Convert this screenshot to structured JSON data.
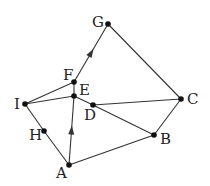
{
  "diagram": {
    "width": 210,
    "height": 186,
    "colors": {
      "edge": "#333333",
      "node": "#111111",
      "label": "#222222",
      "background": "#ffffff"
    },
    "nodes": [
      {
        "id": "G",
        "x": 108,
        "y": 24,
        "label": "G",
        "lx": 92,
        "ly": 27
      },
      {
        "id": "C",
        "x": 181,
        "y": 99,
        "label": "C",
        "lx": 187,
        "ly": 104
      },
      {
        "id": "B",
        "x": 154,
        "y": 135,
        "label": "B",
        "lx": 160,
        "ly": 144
      },
      {
        "id": "D",
        "x": 93,
        "y": 105,
        "label": "D",
        "lx": 84,
        "ly": 120
      },
      {
        "id": "E",
        "x": 74,
        "y": 96,
        "label": "E",
        "lx": 79,
        "ly": 95
      },
      {
        "id": "F",
        "x": 74,
        "y": 82,
        "label": "F",
        "lx": 63,
        "ly": 80
      },
      {
        "id": "I",
        "x": 25,
        "y": 104,
        "label": "I",
        "lx": 14,
        "ly": 109
      },
      {
        "id": "H",
        "x": 44,
        "y": 131,
        "label": "H",
        "lx": 29,
        "ly": 140
      },
      {
        "id": "A",
        "x": 69,
        "y": 165,
        "label": "A",
        "lx": 56,
        "ly": 178
      }
    ],
    "edges": [
      {
        "from": "F",
        "to": "G",
        "arrow": true
      },
      {
        "from": "G",
        "to": "C",
        "arrow": false
      },
      {
        "from": "C",
        "to": "B",
        "arrow": false
      },
      {
        "from": "D",
        "to": "C",
        "arrow": false
      },
      {
        "from": "E",
        "to": "D",
        "arrow": false
      },
      {
        "from": "D",
        "to": "B",
        "arrow": false
      },
      {
        "from": "A",
        "to": "B",
        "arrow": false
      },
      {
        "from": "A",
        "to": "E",
        "arrow": true
      },
      {
        "from": "I",
        "to": "F",
        "arrow": false
      },
      {
        "from": "I",
        "to": "E",
        "arrow": false
      },
      {
        "from": "I",
        "to": "H",
        "arrow": false
      },
      {
        "from": "H",
        "to": "A",
        "arrow": false
      },
      {
        "from": "E",
        "to": "F",
        "arrow": false
      }
    ]
  }
}
